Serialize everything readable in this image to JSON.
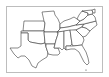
{
  "map": {
    "title": "",
    "region": "Southern United States",
    "colors": {
      "fill": "#ffffff",
      "stroke": "#3a3a3a",
      "frame": "#bdbdbd",
      "background": "#ffffff"
    },
    "states": [
      {
        "id": "KS",
        "name": "Kansas"
      },
      {
        "id": "OK",
        "name": "Oklahoma"
      },
      {
        "id": "TX",
        "name": "Texas"
      },
      {
        "id": "MO",
        "name": "Missouri"
      },
      {
        "id": "AR",
        "name": "Arkansas"
      },
      {
        "id": "LA",
        "name": "Louisiana"
      },
      {
        "id": "KY",
        "name": "Kentucky"
      },
      {
        "id": "TN",
        "name": "Tennessee"
      },
      {
        "id": "MS",
        "name": "Mississippi"
      },
      {
        "id": "AL",
        "name": "Alabama"
      },
      {
        "id": "GA",
        "name": "Georgia"
      },
      {
        "id": "FL",
        "name": "Florida"
      },
      {
        "id": "SC",
        "name": "South Carolina"
      },
      {
        "id": "NC",
        "name": "North Carolina"
      },
      {
        "id": "VA",
        "name": "Virginia"
      },
      {
        "id": "WV",
        "name": "West Virginia"
      },
      {
        "id": "MD",
        "name": "Maryland"
      },
      {
        "id": "DE",
        "name": "Delaware"
      }
    ]
  }
}
